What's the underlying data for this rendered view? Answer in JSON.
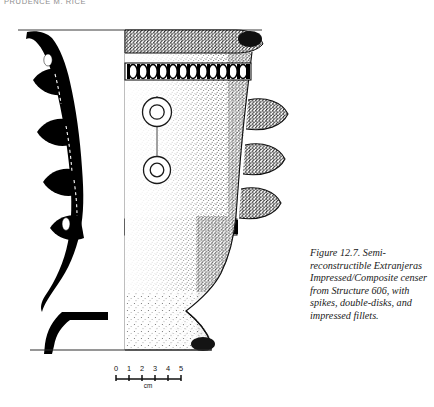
{
  "page": {
    "running_head": "PRUDENCE M. RICE",
    "background_color": "#ffffff",
    "ink_color": "#000000"
  },
  "figure": {
    "caption": "Figure 12.7. Semi-reconstructible Extranjeras Impressed/Composite censer from Structure 606, with spikes, double-disks, and impressed fillets.",
    "caption_label": "Figure 12.7.",
    "subject": "Semi-reconstructible Extranjeras Impressed/Composite censer",
    "provenience": "Structure 606",
    "attributes": [
      "spikes",
      "double-disks",
      "impressed fillets"
    ],
    "illustration_type": "archaeological-vessel-profile-drawing",
    "left_half": "black cross-section profile",
    "right_half": "stippled exterior elevation"
  },
  "scale": {
    "ticks": [
      "0",
      "1",
      "2",
      "3",
      "4",
      "5"
    ],
    "unit": "cm",
    "max": 5
  }
}
